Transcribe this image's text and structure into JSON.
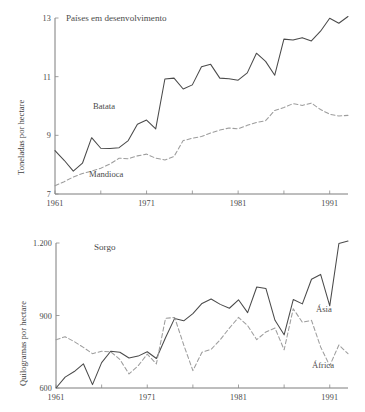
{
  "figure": {
    "width": 365,
    "height": 412,
    "background": "#ffffff",
    "solid_color": "#4a4a4a",
    "dashed_color": "#9d9d9d",
    "axis_color": "#6e6e6e"
  },
  "chart_data": [
    {
      "type": "line",
      "title": "Países em desenvolvimento",
      "xlabel": "",
      "ylabel": "Toneladas por hectare",
      "xlim": [
        1961,
        1993
      ],
      "ylim": [
        7,
        13
      ],
      "xticks": [
        1961,
        1966,
        1971,
        1976,
        1981,
        1986,
        1991
      ],
      "xticklabels": [
        "1961",
        "",
        "1971",
        "",
        "1981",
        "",
        "1991"
      ],
      "yticks": [
        7,
        9,
        11,
        13
      ],
      "yticklabels": [
        "7",
        "9",
        "11",
        "13"
      ],
      "grid": false,
      "legend": "inline-annotations",
      "x": [
        1961,
        1962,
        1963,
        1964,
        1965,
        1966,
        1967,
        1968,
        1969,
        1970,
        1971,
        1972,
        1973,
        1974,
        1975,
        1976,
        1977,
        1978,
        1979,
        1980,
        1981,
        1982,
        1983,
        1984,
        1985,
        1986,
        1987,
        1988,
        1989,
        1990,
        1991,
        1992,
        1993
      ],
      "series": [
        {
          "name": "Batata",
          "style": "solid",
          "label_x": 1967.2,
          "label_y": 9.95,
          "values": [
            8.48,
            8.15,
            7.78,
            8.05,
            8.92,
            8.56,
            8.55,
            8.58,
            8.82,
            9.38,
            9.52,
            9.22,
            10.92,
            10.95,
            10.58,
            10.72,
            11.34,
            11.42,
            10.95,
            10.93,
            10.88,
            11.13,
            11.8,
            11.52,
            11.05,
            12.28,
            12.25,
            12.33,
            12.22,
            12.55,
            12.99,
            12.82,
            13.05
          ]
        },
        {
          "name": "Mandioca",
          "style": "dashed",
          "label_x": 1966.4,
          "label_y": 7.55,
          "values": [
            7.28,
            7.42,
            7.58,
            7.7,
            7.78,
            7.88,
            8.02,
            8.22,
            8.2,
            8.3,
            8.36,
            8.22,
            8.16,
            8.28,
            8.82,
            8.9,
            8.96,
            9.08,
            9.18,
            9.25,
            9.22,
            9.34,
            9.44,
            9.5,
            9.85,
            9.95,
            10.08,
            10.02,
            10.1,
            9.88,
            9.72,
            9.66,
            9.68
          ]
        }
      ]
    },
    {
      "type": "line",
      "title": "Sorgo",
      "xlabel": "",
      "ylabel": "Quilogramas por hectare",
      "xlim": [
        1961,
        1993
      ],
      "ylim": [
        600,
        1200
      ],
      "xticks": [
        1961,
        1966,
        1971,
        1976,
        1981,
        1986,
        1991
      ],
      "xticklabels": [
        "1961",
        "",
        "1971",
        "",
        "1981",
        "",
        "1991"
      ],
      "yticks": [
        600,
        900,
        1200
      ],
      "yticklabels": [
        "600",
        "900",
        "1.200"
      ],
      "grid": false,
      "legend": "inline-annotations",
      "x": [
        1961,
        1962,
        1963,
        1964,
        1965,
        1966,
        1967,
        1968,
        1969,
        1970,
        1971,
        1972,
        1973,
        1974,
        1975,
        1976,
        1977,
        1978,
        1979,
        1980,
        1981,
        1982,
        1983,
        1984,
        1985,
        1986,
        1987,
        1988,
        1989,
        1990,
        1991,
        1992,
        1993
      ],
      "series": [
        {
          "name": "Ásia",
          "style": "solid",
          "label_x": 1989.0,
          "label_y": 898,
          "values": [
            600,
            645,
            668,
            700,
            614,
            705,
            752,
            748,
            724,
            732,
            750,
            722,
            808,
            888,
            878,
            908,
            950,
            968,
            946,
            930,
            965,
            912,
            1018,
            1012,
            880,
            820,
            966,
            948,
            1050,
            1070,
            940,
            1198,
            1208
          ]
        },
        {
          "name": "África",
          "style": "dashed",
          "label_x": 1989.0,
          "label_y": 672,
          "values": [
            800,
            812,
            792,
            768,
            742,
            752,
            750,
            718,
            658,
            692,
            740,
            700,
            888,
            892,
            778,
            672,
            748,
            760,
            800,
            848,
            892,
            858,
            800,
            832,
            848,
            758,
            928,
            872,
            880,
            770,
            692,
            778,
            742
          ]
        }
      ]
    }
  ]
}
